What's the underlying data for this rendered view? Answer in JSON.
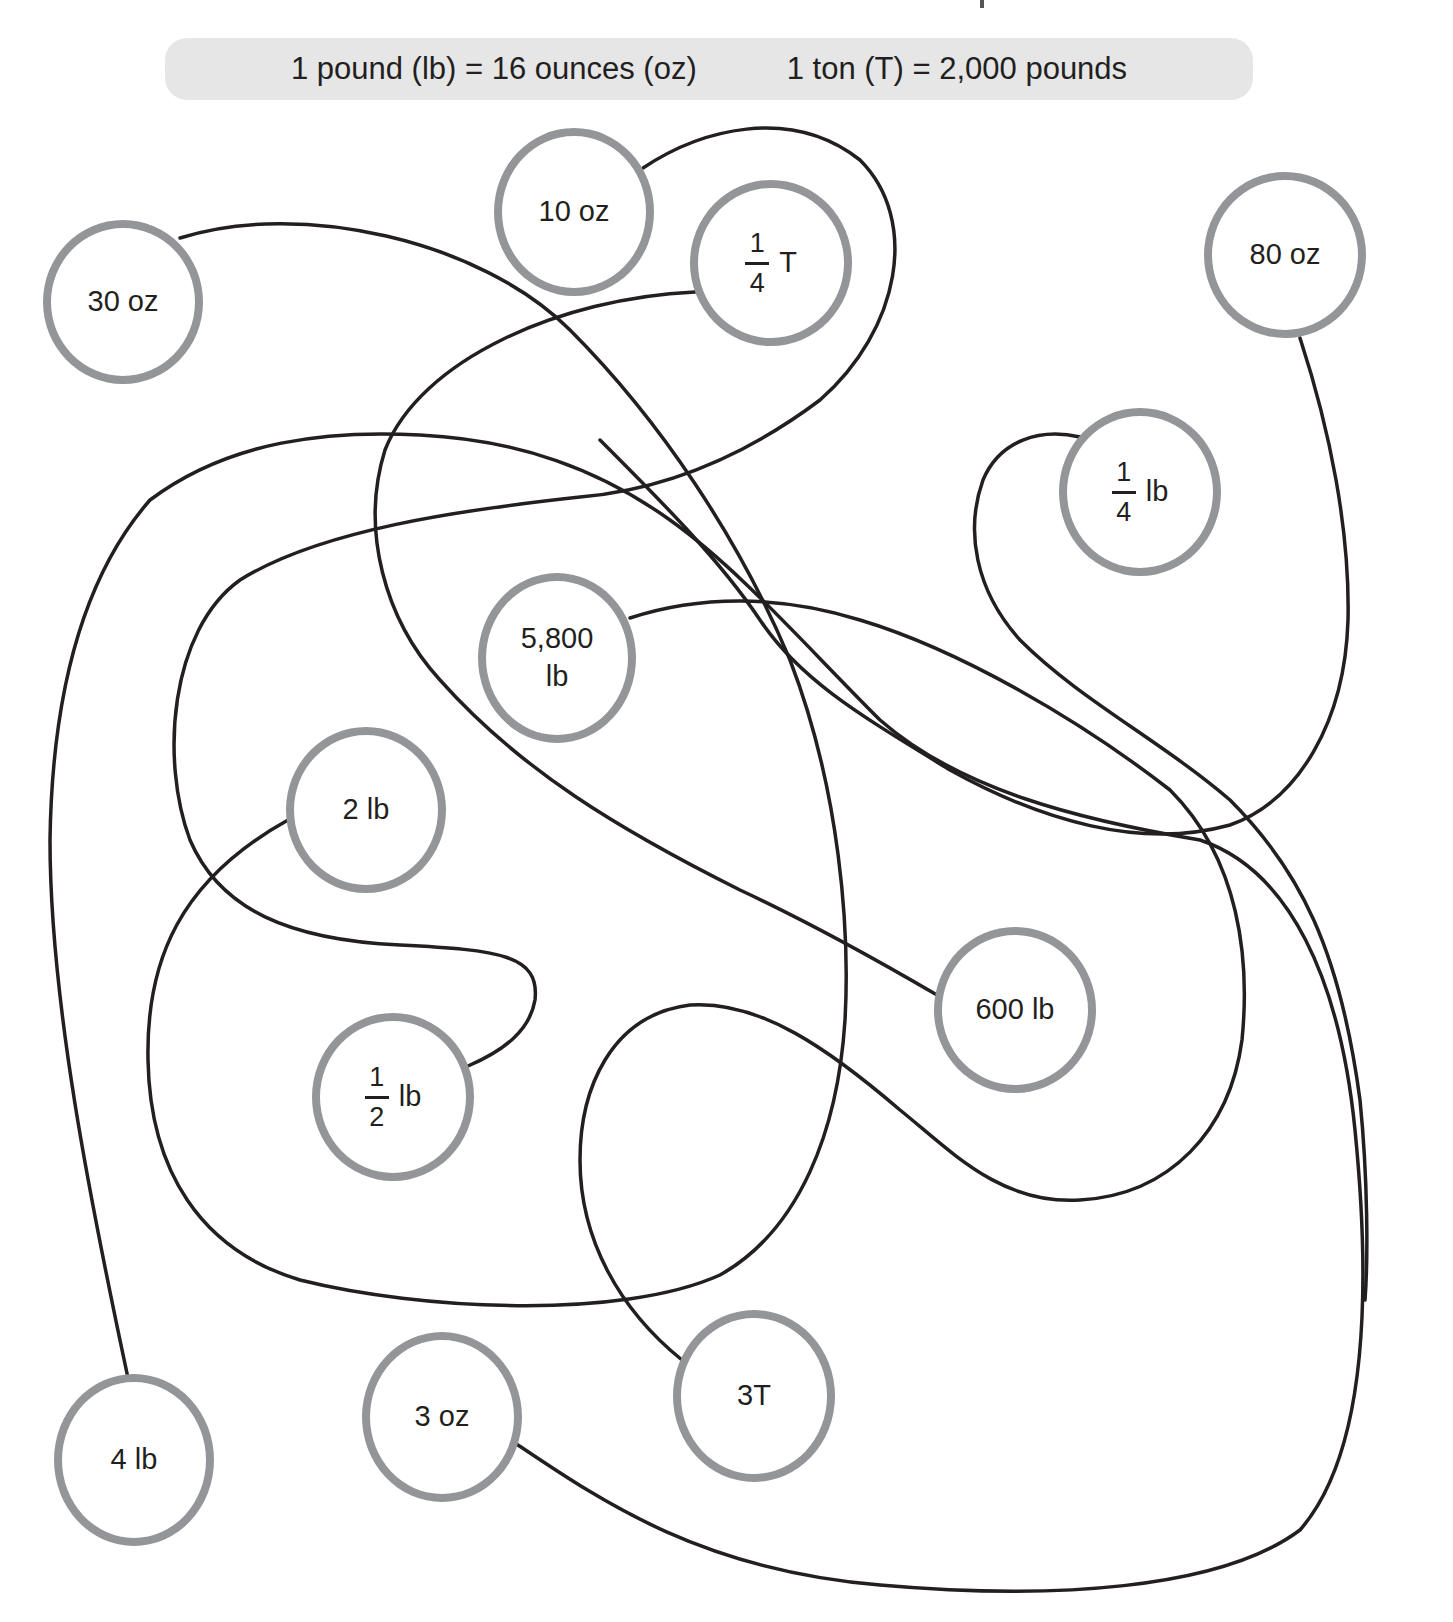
{
  "header": {
    "conversion_1": "1 pound (lb) = 16 ounces (oz)",
    "conversion_2": "1 ton (T) = 2,000 pounds"
  },
  "colors": {
    "banner_bg": "#e6e6e7",
    "circle_border": "#939598",
    "line": "#231f20",
    "text": "#231f20"
  },
  "nodes": [
    {
      "id": "n30oz",
      "label": "30 oz"
    },
    {
      "id": "n10oz",
      "label": "10 oz"
    },
    {
      "id": "nQuarterT",
      "numerator": "1",
      "denominator": "4",
      "unit": "T"
    },
    {
      "id": "n80oz",
      "label": "80 oz"
    },
    {
      "id": "nQuarterLb",
      "numerator": "1",
      "denominator": "4",
      "unit": "lb"
    },
    {
      "id": "n5800",
      "line1": "5,800",
      "line2": "lb"
    },
    {
      "id": "n2lb",
      "label": "2 lb"
    },
    {
      "id": "n600lb",
      "label": "600 lb"
    },
    {
      "id": "nHalfLb",
      "numerator": "1",
      "denominator": "2",
      "unit": "lb"
    },
    {
      "id": "n4lb",
      "label": "4 lb"
    },
    {
      "id": "n3oz",
      "label": "3 oz"
    },
    {
      "id": "n3T",
      "label": "3T"
    }
  ]
}
